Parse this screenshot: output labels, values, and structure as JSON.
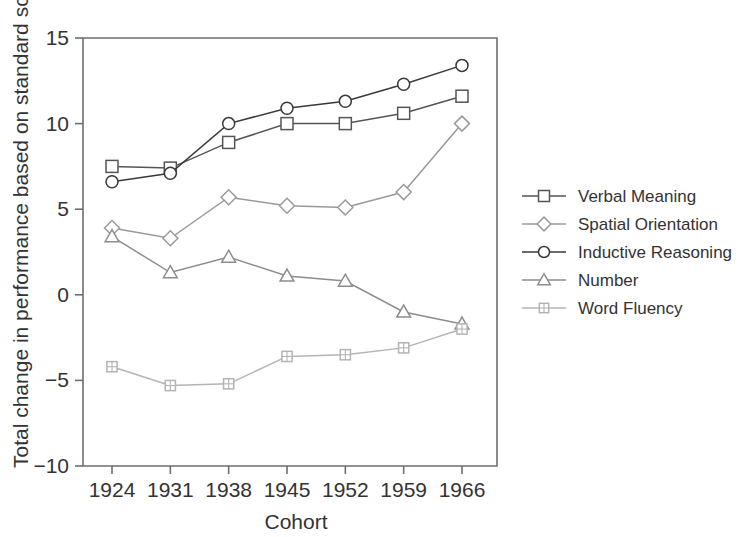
{
  "chart_data": {
    "type": "line",
    "title": "",
    "xlabel": "Cohort",
    "ylabel": "Total change in performance based on standard scores",
    "categories": [
      "1924",
      "1931",
      "1938",
      "1945",
      "1952",
      "1959",
      "1966"
    ],
    "x": [
      1924,
      1931,
      1938,
      1945,
      1952,
      1959,
      1966
    ],
    "ylim": [
      -10,
      15
    ],
    "yticks": [
      "15",
      "10",
      "5",
      "0",
      "-5",
      "-10"
    ],
    "ytick_values": [
      15,
      10,
      5,
      0,
      -5,
      -10
    ],
    "grid": false,
    "legend_position": "right",
    "series": [
      {
        "name": "Verbal Meaning",
        "marker": "square",
        "color": "#555555",
        "values": [
          7.5,
          7.4,
          8.9,
          10.0,
          10.0,
          10.6,
          11.6
        ]
      },
      {
        "name": "Spatial Orientation",
        "marker": "diamond",
        "color": "#9a9a9a",
        "values": [
          3.9,
          3.3,
          5.7,
          5.2,
          5.1,
          6.0,
          10.0
        ]
      },
      {
        "name": "Inductive Reasoning",
        "marker": "circle",
        "color": "#3a3a3a",
        "values": [
          6.6,
          7.1,
          10.0,
          10.9,
          11.3,
          12.3,
          13.4
        ]
      },
      {
        "name": "Number",
        "marker": "triangle",
        "color": "#8d8d8d",
        "values": [
          3.4,
          1.3,
          2.2,
          1.1,
          0.8,
          -1.0,
          -1.7
        ]
      },
      {
        "name": "Word Fluency",
        "marker": "grid-square",
        "color": "#b4b4b4",
        "values": [
          -4.2,
          -5.3,
          -5.2,
          -3.6,
          -3.5,
          -3.1,
          -2.0
        ]
      }
    ]
  },
  "axes": {
    "x_title": "Cohort",
    "y_title": "Total change in performance based on standard scores"
  },
  "legend": {
    "entries": [
      {
        "label": "Verbal Meaning"
      },
      {
        "label": "Spatial Orientation"
      },
      {
        "label": "Inductive Reasoning"
      },
      {
        "label": "Number"
      },
      {
        "label": "Word Fluency"
      }
    ]
  },
  "colors": {
    "axis": "#6e6e6e",
    "text": "#333333",
    "background": "#ffffff"
  }
}
